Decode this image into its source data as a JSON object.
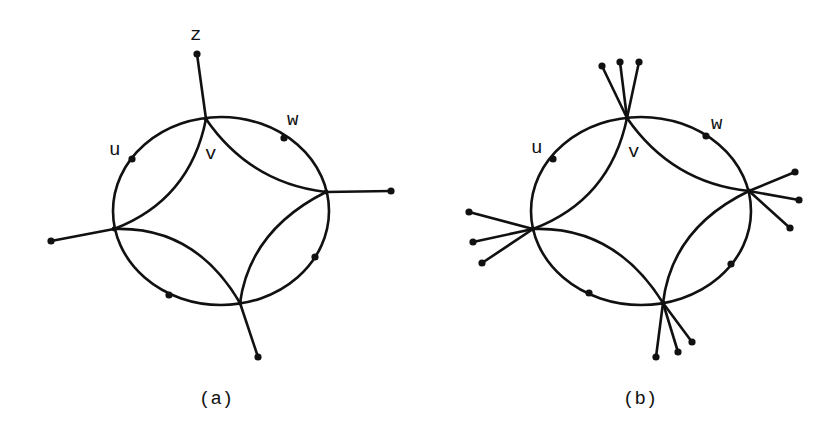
{
  "figures": [
    {
      "id": "a",
      "caption": "(a)",
      "labels": {
        "z": "z",
        "u": "u",
        "v": "v",
        "w": "w"
      },
      "ellipse": {
        "cx": 221,
        "cy": 211,
        "rx": 108,
        "ry": 94
      },
      "hubs": {
        "top": [
          206,
          119
        ],
        "right": [
          326,
          192
        ],
        "left": [
          114,
          229
        ],
        "bottom": [
          240,
          303
        ]
      },
      "pendants": {
        "top": [
          [
            197,
            54
          ]
        ],
        "right": [
          [
            391,
            191
          ]
        ],
        "left": [
          [
            51,
            241
          ]
        ],
        "bottom": [
          [
            258,
            357
          ]
        ]
      },
      "cycle_dots": [
        [
          132,
          159
        ],
        [
          284,
          138
        ],
        [
          315,
          257
        ],
        [
          169,
          295
        ]
      ]
    },
    {
      "id": "b",
      "caption": "(b)",
      "labels": {
        "u": "u",
        "v": "v",
        "w": "w"
      },
      "ellipse": {
        "cx": 641,
        "cy": 211,
        "rx": 110,
        "ry": 94
      },
      "hubs": {
        "top": [
          627,
          118
        ],
        "right": [
          749,
          191
        ],
        "left": [
          533,
          229
        ],
        "bottom": [
          663,
          303
        ]
      },
      "pendants": {
        "top": [
          [
            602,
            66
          ],
          [
            620,
            62
          ],
          [
            639,
            62
          ]
        ],
        "right": [
          [
            795,
            172
          ],
          [
            799,
            200
          ],
          [
            790,
            228
          ]
        ],
        "left": [
          [
            469,
            212
          ],
          [
            473,
            242
          ],
          [
            482,
            263
          ]
        ],
        "bottom": [
          [
            656,
            357
          ],
          [
            678,
            352
          ],
          [
            692,
            342
          ]
        ]
      },
      "cycle_dots": [
        [
          553,
          159
        ],
        [
          706,
          136
        ],
        [
          731,
          264
        ],
        [
          589,
          293
        ]
      ]
    }
  ]
}
